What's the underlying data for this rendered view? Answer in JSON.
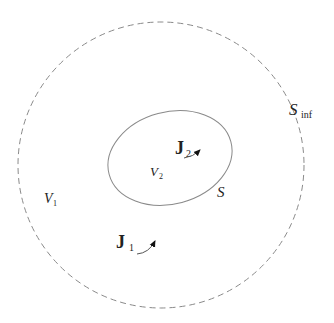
{
  "diagram": {
    "type": "electromagnetic-regions",
    "colors": {
      "background": "#ffffff",
      "outer_boundary": "#8a8a8a",
      "inner_boundary": "#8a8a8a",
      "text": "#222222",
      "arrow": "#111111"
    },
    "outer_boundary": {
      "label": "S",
      "label_subscript": "inf",
      "style": "dashed circle"
    },
    "inner_boundary": {
      "label": "S",
      "style": "solid ellipse"
    },
    "regions": [
      {
        "label": "V",
        "subscript": "1",
        "description": "region between S and S_inf"
      },
      {
        "label": "V",
        "subscript": "2",
        "description": "region inside S"
      }
    ],
    "currents": [
      {
        "label": "J",
        "subscript": "1",
        "location": "region V1"
      },
      {
        "label": "J",
        "subscript": "2",
        "location": "region V2"
      }
    ]
  }
}
